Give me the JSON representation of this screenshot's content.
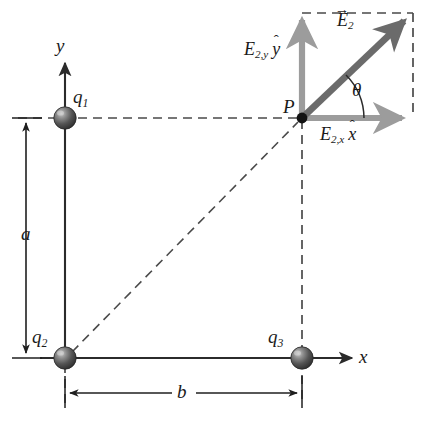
{
  "figure": {
    "colors": {
      "line": "#2b2b2b",
      "dashed": "#4a4a4a",
      "component_arrow": "#9a9a9a",
      "resultant_arrow": "#6e6e6e",
      "sphere_dark": "#3a3a3a",
      "sphere_light": "#bdbdbd",
      "background": "#ffffff"
    },
    "axes": {
      "x_label": "x",
      "y_label": "y"
    },
    "charges": [
      {
        "id": "q1",
        "label": "q",
        "subscript": "1",
        "x": 65,
        "y": 118
      },
      {
        "id": "q2",
        "label": "q",
        "subscript": "2",
        "x": 65,
        "y": 358
      },
      {
        "id": "q3",
        "label": "q",
        "subscript": "3",
        "x": 302,
        "y": 358
      }
    ],
    "point": {
      "label": "P",
      "x": 302,
      "y": 118
    },
    "dimensions": [
      {
        "id": "a",
        "label": "a",
        "orientation": "vertical",
        "from": 118,
        "to": 358
      },
      {
        "id": "b",
        "label": "b",
        "orientation": "horizontal",
        "from": 65,
        "to": 302
      }
    ],
    "vectors": {
      "resultant": {
        "label": "E",
        "subscript": "2",
        "accent": "vector"
      },
      "y_component": {
        "label": "E",
        "subscript": "2,y",
        "unit": "y",
        "accent": "hat"
      },
      "x_component": {
        "label": "E",
        "subscript": "2,x",
        "unit": "x",
        "accent": "hat"
      },
      "angle": {
        "label": "θ"
      }
    },
    "caption": ""
  }
}
